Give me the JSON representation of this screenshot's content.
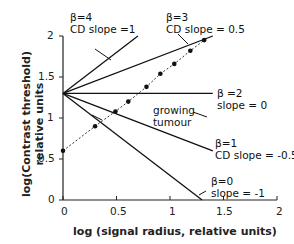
{
  "chart_data": {
    "type": "line",
    "title": "",
    "xlabel": "log (signal radius, relative units)",
    "ylabel_line1": "log(Contrast threshold)",
    "ylabel_line2": "relative units",
    "xlim": [
      0,
      2
    ],
    "ylim": [
      0,
      2
    ],
    "x_ticks": [
      "0",
      "0.5",
      "1",
      "1.5",
      "2"
    ],
    "y_ticks": [
      "0",
      "0.5",
      "1",
      "1.5",
      "2"
    ],
    "grid": false,
    "legend": "none (inline annotations)",
    "series": [
      {
        "name": "β=4",
        "annotation": [
          "β=4",
          "CD slope =1"
        ],
        "slope": 1,
        "x": [
          0,
          0.7
        ],
        "y": [
          1.3,
          2.0
        ]
      },
      {
        "name": "β=3",
        "annotation": [
          "β=3",
          "CD slope = 0.5"
        ],
        "slope": 0.5,
        "x": [
          0,
          1.4
        ],
        "y": [
          1.3,
          2.0
        ]
      },
      {
        "name": "β=2",
        "annotation": [
          "β =2",
          "slope = 0"
        ],
        "slope": 0,
        "x": [
          0,
          1.4
        ],
        "y": [
          1.3,
          1.3
        ]
      },
      {
        "name": "β=1",
        "annotation": [
          "β=1",
          "CD slope = -0.5"
        ],
        "slope": -0.5,
        "x": [
          0,
          1.4
        ],
        "y": [
          1.3,
          0.6
        ]
      },
      {
        "name": "β=0",
        "annotation": [
          "β=0",
          "slope = -1"
        ],
        "slope": -1,
        "x": [
          0,
          1.3
        ],
        "y": [
          1.3,
          0.0
        ]
      },
      {
        "name": "growing tumour",
        "annotation": [
          "growing",
          "tumour"
        ],
        "style": "dotted with markers",
        "x": [
          0,
          0.3,
          0.49,
          0.61,
          0.78,
          0.91,
          1.04,
          1.19,
          1.32
        ],
        "y": [
          0.6,
          0.9,
          1.08,
          1.2,
          1.38,
          1.54,
          1.66,
          1.82,
          1.95
        ]
      }
    ]
  }
}
